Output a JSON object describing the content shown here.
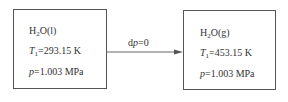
{
  "diagram": {
    "type": "process",
    "left_state": {
      "species": "H",
      "species_sub": "2",
      "species_rest": "O(l)",
      "temperature_symbol": "T",
      "temperature_sub": "1",
      "temperature_value": "=293.15 K",
      "pressure_symbol": "p",
      "pressure_value": "=1.003 MPa"
    },
    "right_state": {
      "species": "H",
      "species_sub": "2",
      "species_rest": "O(g)",
      "temperature_symbol": "T",
      "temperature_sub": "1",
      "temperature_value": "=453.15 K",
      "pressure_symbol": "p",
      "pressure_value": "=1.003 MPa"
    },
    "arrow": {
      "label_prefix": "d",
      "label_symbol": "p",
      "label_value": "=0"
    },
    "colors": {
      "border": "#555555",
      "text": "#333333",
      "background": "#ffffff"
    }
  }
}
